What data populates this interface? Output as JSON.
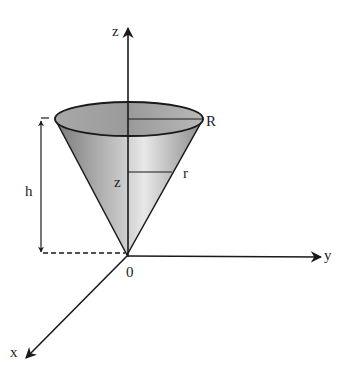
{
  "diagram": {
    "labels": {
      "z_axis": "z",
      "y_axis": "y",
      "x_axis": "x",
      "origin": "0",
      "height": "h",
      "top_radius": "R",
      "slice_radius": "r",
      "slice_height": "z"
    },
    "colors": {
      "line": "#1a1a1a",
      "cone_dark": "#6e6e6e",
      "cone_light": "#e6e6e6",
      "top_fill": "#b0b0b0"
    }
  }
}
